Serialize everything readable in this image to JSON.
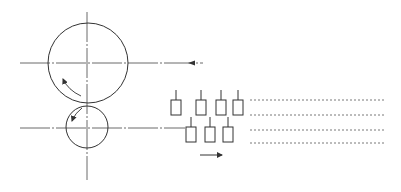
{
  "diagram": {
    "type": "rolling-mill-schematic",
    "colors": {
      "line": "#333333",
      "background": "#ffffff"
    },
    "large_roll": {
      "cx": 88,
      "cy": 63,
      "r": 40,
      "rotation": "counter-clockwise"
    },
    "small_roll": {
      "cx": 87,
      "cy": 127,
      "r": 21,
      "rotation": "counter-clockwise"
    },
    "center_lines": {
      "vertical": {
        "x": 87,
        "y1": 12,
        "y2": 180
      },
      "upper_horizontal": {
        "y": 63,
        "x1": 20,
        "x2": 203,
        "arrow": "left"
      },
      "lower_horizontal": {
        "y": 128,
        "x1": 20,
        "x2": 185
      }
    },
    "top_row_blocks": [
      {
        "x": 171,
        "y": 100,
        "w": 10,
        "h": 15
      },
      {
        "x": 196,
        "y": 100,
        "w": 10,
        "h": 15
      },
      {
        "x": 216,
        "y": 100,
        "w": 10,
        "h": 15
      },
      {
        "x": 233,
        "y": 100,
        "w": 10,
        "h": 15
      }
    ],
    "bottom_row_blocks": [
      {
        "x": 186,
        "y": 127,
        "w": 10,
        "h": 15
      },
      {
        "x": 205,
        "y": 127,
        "w": 10,
        "h": 15
      },
      {
        "x": 223,
        "y": 127,
        "w": 10,
        "h": 15
      }
    ],
    "dashed_lines": [
      {
        "y": 100,
        "x1": 250,
        "x2": 386
      },
      {
        "y": 115,
        "x1": 250,
        "x2": 386
      },
      {
        "y": 130,
        "x1": 250,
        "x2": 386
      },
      {
        "y": 143,
        "x1": 250,
        "x2": 386
      }
    ],
    "motion_arrow": {
      "y": 155,
      "x1": 200,
      "x2": 222,
      "direction": "right"
    }
  }
}
